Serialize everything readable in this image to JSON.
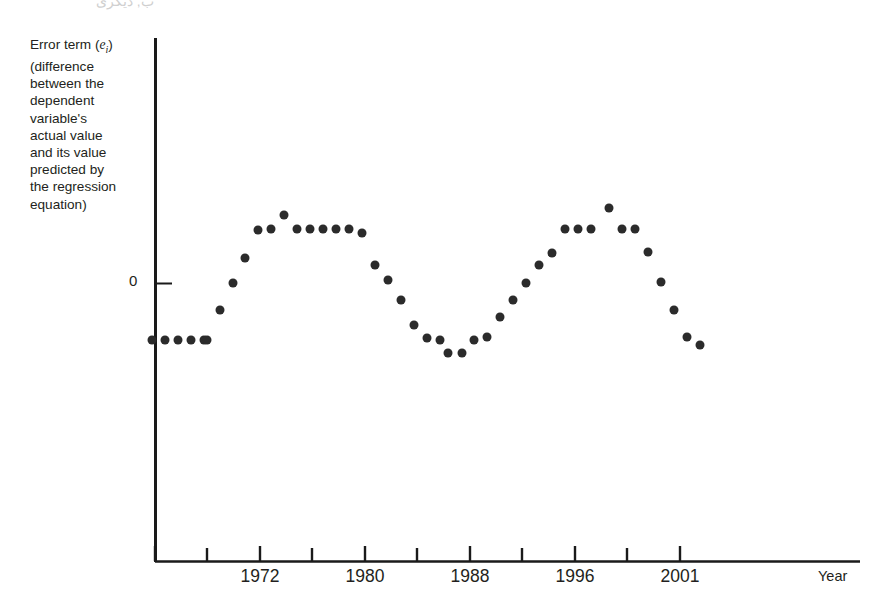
{
  "page_bleed_text": "ب, ديگری",
  "axis": {
    "y_label_lines": [
      "Error term (e",
      "i",
      ")",
      "(difference",
      "between the",
      "dependent",
      "variable's",
      "actual value",
      "and its value",
      "predicted by",
      "the regression",
      "equation)"
    ],
    "y_label_text": "Error term (e_i) (difference between the dependent variable's actual value and its value predicted by the regression equation)",
    "y_zero_tick_label": "0",
    "x_axis_title": "Year",
    "x_tick_labels": [
      "1972",
      "1980",
      "1988",
      "1996",
      "2001"
    ],
    "axis_color": "#1a1a1a"
  },
  "chart_data": {
    "type": "scatter",
    "title": "",
    "subtitle": "",
    "xlabel": "Year",
    "ylabel": "Error term (e_i) (difference between the dependent variable's actual value and its value predicted by the regression equation)",
    "grid": false,
    "legend": null,
    "marker": {
      "shape": "circle",
      "color": "#2b2b2b",
      "size_px": 9
    },
    "y_reference_line": {
      "value": 0,
      "label": "0"
    },
    "x_tick_values": [
      1968,
      1972,
      1976,
      1980,
      1984,
      1988,
      1992,
      1996,
      2001
    ],
    "x_labeled_ticks": [
      1972,
      1980,
      1988,
      1996,
      2001
    ],
    "xlim": [
      1965.5,
      2003.0
    ],
    "ylim": [
      -1.35,
      1.35
    ],
    "note": "Residual plot showing serial correlation: residuals follow a slow cyclical wave over time.",
    "points": [
      {
        "x": 1966.0,
        "y": -0.52
      },
      {
        "x": 1967.0,
        "y": -0.52
      },
      {
        "x": 1968.0,
        "y": -0.52
      },
      {
        "x": 1969.0,
        "y": -0.52
      },
      {
        "x": 1970.0,
        "y": -0.52
      },
      {
        "x": 1971.0,
        "y": -0.52
      },
      {
        "x": 1972.0,
        "y": -0.21
      },
      {
        "x": 1973.0,
        "y": 0.0
      },
      {
        "x": 1974.0,
        "y": 0.26
      },
      {
        "x": 1975.0,
        "y": 0.54
      },
      {
        "x": 1976.0,
        "y": 0.76
      },
      {
        "x": 1977.0,
        "y": 0.76
      },
      {
        "x": 1978.0,
        "y": 0.91
      },
      {
        "x": 1979.0,
        "y": 0.76
      },
      {
        "x": 1980.0,
        "y": 0.76
      },
      {
        "x": 1981.0,
        "y": 0.76
      },
      {
        "x": 1982.0,
        "y": 0.76
      },
      {
        "x": 1983.0,
        "y": 0.7
      },
      {
        "x": 1984.0,
        "y": 0.36
      },
      {
        "x": 1985.0,
        "y": 0.21
      },
      {
        "x": 1986.0,
        "y": 0.0
      },
      {
        "x": 1987.0,
        "y": -0.3
      },
      {
        "x": 1988.0,
        "y": -0.45
      },
      {
        "x": 1989.0,
        "y": -0.47
      },
      {
        "x": 1990.0,
        "y": -0.58
      },
      {
        "x": 1991.0,
        "y": -0.6
      },
      {
        "x": 1992.0,
        "y": -0.47
      },
      {
        "x": 1993.0,
        "y": -0.44
      },
      {
        "x": 1994.0,
        "y": -0.23
      },
      {
        "x": 1995.0,
        "y": -0.07
      },
      {
        "x": 1996.0,
        "y": 0.09
      },
      {
        "x": 1997.0,
        "y": 0.26
      },
      {
        "x": 1998.0,
        "y": 0.38
      },
      {
        "x": 1999.0,
        "y": 0.74
      },
      {
        "x": 2000.0,
        "y": 0.74
      },
      {
        "x": 2001.0,
        "y": 0.74
      },
      {
        "x": 2002.0,
        "y": 0.93
      },
      {
        "x": 2003.0,
        "y": 0.74
      },
      {
        "x": 2004.0,
        "y": 0.74
      },
      {
        "x": 2005.0,
        "y": 0.55
      },
      {
        "x": 2006.0,
        "y": 0.33
      },
      {
        "x": 2007.0,
        "y": 0.03
      },
      {
        "x": 2008.0,
        "y": -0.24
      },
      {
        "x": 2009.0,
        "y": -0.39
      }
    ],
    "points_pixel": [
      [
        152,
        340
      ],
      [
        165,
        340
      ],
      [
        178,
        340
      ],
      [
        191,
        340
      ],
      [
        204,
        340
      ],
      [
        207,
        340
      ],
      [
        220,
        310
      ],
      [
        233,
        283
      ],
      [
        245,
        258
      ],
      [
        258,
        230
      ],
      [
        271,
        229
      ],
      [
        284,
        215
      ],
      [
        297,
        229
      ],
      [
        310,
        229
      ],
      [
        323,
        229
      ],
      [
        336,
        229
      ],
      [
        349,
        229
      ],
      [
        362,
        233
      ],
      [
        375,
        265
      ],
      [
        388,
        280
      ],
      [
        401,
        300
      ],
      [
        414,
        325
      ],
      [
        427,
        338
      ],
      [
        440,
        340
      ],
      [
        448,
        353
      ],
      [
        462,
        353
      ],
      [
        474,
        340
      ],
      [
        487,
        337
      ],
      [
        500,
        317
      ],
      [
        513,
        300
      ],
      [
        526,
        283
      ],
      [
        539,
        265
      ],
      [
        552,
        253
      ],
      [
        565,
        229
      ],
      [
        578,
        229
      ],
      [
        591,
        229
      ],
      [
        609,
        208
      ],
      [
        622,
        229
      ],
      [
        635,
        229
      ],
      [
        648,
        252
      ],
      [
        661,
        282
      ],
      [
        674,
        310
      ],
      [
        687,
        337
      ],
      [
        700,
        345
      ]
    ]
  }
}
